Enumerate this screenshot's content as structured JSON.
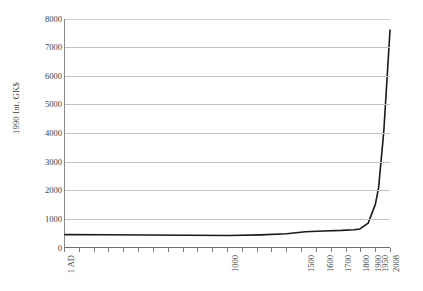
{
  "chart_data": {
    "type": "line",
    "title": "",
    "subtitle": "",
    "xlabel": "",
    "ylabel": "1990 Int. GK$",
    "ylim": [
      0,
      8000
    ],
    "y_ticks": [
      0,
      1000,
      2000,
      3000,
      4000,
      5000,
      6000,
      7000,
      8000
    ],
    "grid": "horizontal",
    "legend": "none",
    "axis_type": "categorical",
    "categories": [
      "1 AD",
      "1000",
      "1500",
      "1600",
      "1700",
      "1820",
      "1870",
      "1900",
      "1913",
      "1950",
      "1973",
      "2008"
    ],
    "x_tick_labels": [
      "1 AD",
      "1000",
      "1500",
      "1600",
      "1700",
      "1800",
      "1900",
      "1950",
      "2008"
    ],
    "x_tick_label_positions": [
      0.0,
      0.503,
      0.737,
      0.793,
      0.849,
      0.905,
      0.943,
      0.962,
      0.997
    ],
    "series": [
      {
        "name": "World GDP per capita",
        "color": "#1a1a1a",
        "points": [
          {
            "x": 0.0,
            "label": "1 AD",
            "value": 467
          },
          {
            "x": 0.12,
            "label": "",
            "value": 462
          },
          {
            "x": 0.25,
            "label": "",
            "value": 455
          },
          {
            "x": 0.38,
            "label": "",
            "value": 448
          },
          {
            "x": 0.503,
            "label": "1000",
            "value": 435
          },
          {
            "x": 0.6,
            "label": "",
            "value": 460
          },
          {
            "x": 0.68,
            "label": "",
            "value": 500
          },
          {
            "x": 0.737,
            "label": "1500",
            "value": 566
          },
          {
            "x": 0.793,
            "label": "1600",
            "value": 596
          },
          {
            "x": 0.849,
            "label": "1700",
            "value": 616
          },
          {
            "x": 0.887,
            "label": "1800",
            "value": 640
          },
          {
            "x": 0.905,
            "label": "1820",
            "value": 666
          },
          {
            "x": 0.93,
            "label": "1870",
            "value": 870
          },
          {
            "x": 0.943,
            "label": "1900",
            "value": 1261
          },
          {
            "x": 0.952,
            "label": "1913",
            "value": 1524
          },
          {
            "x": 0.962,
            "label": "1950",
            "value": 2111
          },
          {
            "x": 0.978,
            "label": "1973",
            "value": 4091
          },
          {
            "x": 0.997,
            "label": "2008",
            "value": 7614
          }
        ]
      }
    ],
    "x_tick_count": 23,
    "colors": {
      "line": "#1a1a1a",
      "gridline": "#c3c3c3",
      "axis": "#6e6e6e",
      "text": "#3d3d3d",
      "background": "#ffffff"
    }
  }
}
